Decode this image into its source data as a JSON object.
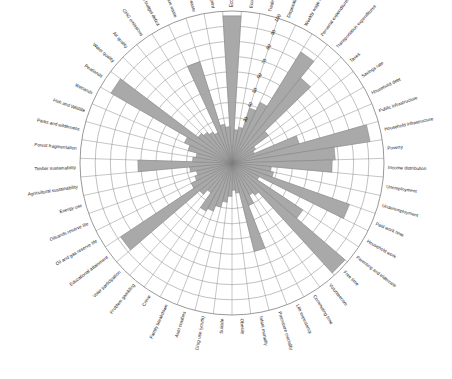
{
  "figure": {
    "title": "",
    "background_color": "#ffffff",
    "wedge_fill": "#a9a9a9",
    "wedge_stroke": "#7d7d7d",
    "grid_color": "#8d8d8d",
    "label_color": "#1a1a1a",
    "center": {
      "x": 232,
      "y": 163
    },
    "outer_radius": 152
  },
  "chart_data": {
    "type": "bar",
    "subtype": "polar-rose-radar",
    "title": "",
    "xlabel": "",
    "ylabel": "",
    "ylim": [
      0,
      100
    ],
    "grid": true,
    "legend": "none",
    "radial_ticks": [
      30,
      40,
      50,
      60,
      70,
      80,
      90,
      100
    ],
    "radial_tick_labels": [
      "30",
      "40",
      "50",
      "60",
      "70",
      "80",
      "90",
      "100"
    ],
    "angular_start_deg": 90,
    "angular_direction": "clockwise",
    "categories": [
      "Economic growth",
      "Economic diversity",
      "Trade",
      "Disposable income",
      "Weekly wage rate",
      "Personal expenditures",
      "Transportation expenditures",
      "Taxes",
      "Savings rate",
      "Household debt",
      "Public infrastructure",
      "Household infrastructure",
      "Poverty",
      "Income distribution",
      "Unemployment",
      "Underemployment",
      "Paid work time",
      "Household work",
      "Parenting and eldercare",
      "Free time",
      "Volunteerism",
      "Commuting time",
      "Life expectancy",
      "Premature mortality",
      "Infant mortality",
      "Obesity",
      "Suicide",
      "Drug use (youth)",
      "Auto crashes",
      "Family breakdown",
      "Crime",
      "Problem gambling",
      "Voter participation",
      "Educational attainment",
      "Oil and gas reserve life",
      "Oilsands reserve life",
      "Energy use",
      "Agricultural sustainability",
      "Timber sustainability",
      "Forest fragmentation",
      "Parks and wilderness",
      "Fish and Wildlife",
      "Wetlands",
      "Peatlands",
      "Water quality",
      "Air quality",
      "GHG emissions",
      "Carbon budget deficit",
      "Hazardous waste",
      "Landfill waste",
      "Ecological footprint"
    ],
    "values": [
      97,
      22,
      24,
      38,
      44,
      86,
      72,
      30,
      18,
      16,
      46,
      92,
      68,
      66,
      26,
      28,
      82,
      20,
      56,
      98,
      26,
      24,
      30,
      60,
      20,
      18,
      22,
      26,
      30,
      34,
      36,
      24,
      28,
      88,
      30,
      26,
      24,
      28,
      62,
      26,
      24,
      30,
      34,
      92,
      28,
      26,
      24,
      22,
      70,
      26,
      24
    ],
    "series": [
      {
        "name": "Indicator value",
        "values": [
          97,
          22,
          24,
          38,
          44,
          86,
          72,
          30,
          18,
          16,
          46,
          92,
          68,
          66,
          26,
          28,
          82,
          20,
          56,
          98,
          26,
          24,
          30,
          60,
          20,
          18,
          22,
          26,
          30,
          34,
          36,
          24,
          28,
          88,
          30,
          26,
          24,
          28,
          62,
          26,
          24,
          30,
          34,
          92,
          28,
          26,
          24,
          22,
          70,
          26,
          24
        ]
      }
    ]
  }
}
